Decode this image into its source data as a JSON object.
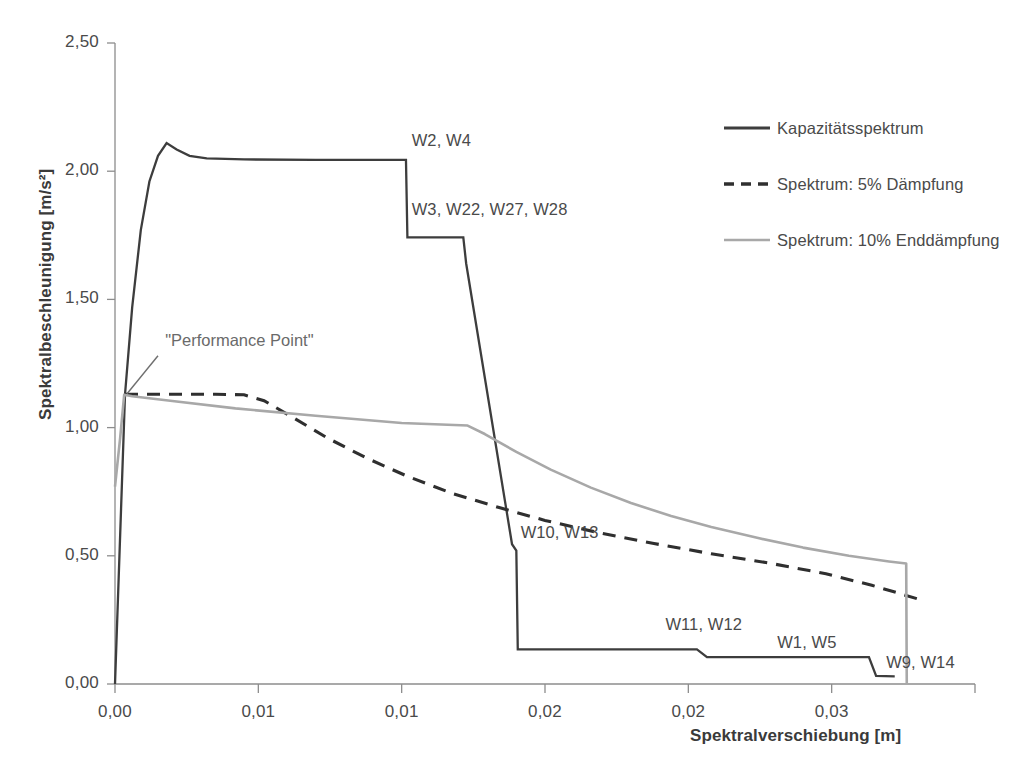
{
  "chart_data": {
    "type": "line",
    "title": "",
    "xlabel": "Spektralverschiebung [m]",
    "ylabel": "Spektralbeschleunigung [m/s²]",
    "xlim": [
      0,
      0.03
    ],
    "ylim": [
      0,
      2.5
    ],
    "grid": false,
    "legend_position": "right",
    "xticks": [
      0,
      0.005,
      0.01,
      0.015,
      0.02,
      0.025,
      0.03
    ],
    "xtick_labels": [
      "0,00",
      "0,01",
      "0,01",
      "0,02",
      "0,02",
      "0,03"
    ],
    "yticks": [
      0,
      0.5,
      1.0,
      1.5,
      2.0,
      2.5
    ],
    "ytick_labels": [
      "0,00",
      "0,50",
      "1,00",
      "1,50",
      "2,00",
      "2,50"
    ],
    "series": [
      {
        "name": "Kapazitätsspektrum",
        "style": "solid",
        "color": "#3d3d3d",
        "points": [
          [
            0.0,
            0.0
          ],
          [
            0.00035,
            1.13
          ],
          [
            0.0006,
            1.47
          ],
          [
            0.0009,
            1.77
          ],
          [
            0.0012,
            1.96
          ],
          [
            0.0015,
            2.06
          ],
          [
            0.0018,
            2.11
          ],
          [
            0.00215,
            2.085
          ],
          [
            0.0026,
            2.06
          ],
          [
            0.0032,
            2.05
          ],
          [
            0.0045,
            2.046
          ],
          [
            0.007,
            2.044
          ],
          [
            0.01015,
            2.044
          ],
          [
            0.0102,
            1.742
          ],
          [
            0.012,
            1.742
          ],
          [
            0.01215,
            1.742
          ],
          [
            0.01225,
            1.64
          ],
          [
            0.01385,
            0.545
          ],
          [
            0.014,
            0.52
          ],
          [
            0.01405,
            0.135
          ],
          [
            0.0203,
            0.135
          ],
          [
            0.02065,
            0.105
          ],
          [
            0.0263,
            0.105
          ],
          [
            0.02655,
            0.032
          ],
          [
            0.0272,
            0.03
          ]
        ]
      },
      {
        "name": "Spektrum: 5% Dämpfung",
        "style": "dashed",
        "color": "#2f2f2f",
        "points": [
          [
            0.00035,
            1.13
          ],
          [
            0.002,
            1.13
          ],
          [
            0.0035,
            1.13
          ],
          [
            0.0045,
            1.128
          ],
          [
            0.0052,
            1.105
          ],
          [
            0.0062,
            1.04
          ],
          [
            0.0074,
            0.96
          ],
          [
            0.0088,
            0.88
          ],
          [
            0.0102,
            0.81
          ],
          [
            0.0118,
            0.742
          ],
          [
            0.0134,
            0.688
          ],
          [
            0.015,
            0.638
          ],
          [
            0.0168,
            0.592
          ],
          [
            0.0188,
            0.548
          ],
          [
            0.0208,
            0.508
          ],
          [
            0.0228,
            0.472
          ],
          [
            0.0248,
            0.43
          ],
          [
            0.0264,
            0.385
          ],
          [
            0.0274,
            0.352
          ],
          [
            0.028,
            0.332
          ]
        ]
      },
      {
        "name": "Spektrum: 10% Enddämpfung",
        "style": "solid",
        "color": "#a8a8a8",
        "points": [
          [
            0.0,
            0.77
          ],
          [
            0.00018,
            0.96
          ],
          [
            0.00032,
            1.128
          ],
          [
            0.0006,
            1.122
          ],
          [
            0.002,
            1.104
          ],
          [
            0.0042,
            1.075
          ],
          [
            0.007,
            1.046
          ],
          [
            0.01,
            1.018
          ],
          [
            0.0123,
            1.008
          ],
          [
            0.0129,
            0.975
          ],
          [
            0.014,
            0.905
          ],
          [
            0.0152,
            0.836
          ],
          [
            0.0166,
            0.766
          ],
          [
            0.018,
            0.706
          ],
          [
            0.0194,
            0.655
          ],
          [
            0.0208,
            0.612
          ],
          [
            0.0224,
            0.57
          ],
          [
            0.024,
            0.532
          ],
          [
            0.0256,
            0.5
          ],
          [
            0.027,
            0.478
          ],
          [
            0.0276,
            0.47
          ],
          [
            0.02762,
            0.0
          ]
        ]
      }
    ],
    "point_labels": [
      {
        "text": "W2, W4",
        "x": 0.01035,
        "y": 2.115
      },
      {
        "text": "W3, W22, W27, W28",
        "x": 0.01035,
        "y": 1.845
      },
      {
        "text": "W10, W13",
        "x": 0.01415,
        "y": 0.585
      },
      {
        "text": "W11, W12",
        "x": 0.0192,
        "y": 0.225
      },
      {
        "text": "W1, W5",
        "x": 0.0231,
        "y": 0.155
      },
      {
        "text": "W9, W14",
        "x": 0.0269,
        "y": 0.078
      }
    ],
    "annotations": [
      {
        "text": "\"Performance Point\"",
        "x": 0.00175,
        "y": 1.335,
        "leader_from": [
          0.0015,
          1.28
        ],
        "leader_to": [
          0.00042,
          1.132
        ]
      }
    ]
  },
  "legend": {
    "items": [
      {
        "label": "Kapazitätsspektrum",
        "style": "solid",
        "color": "#3d3d3d"
      },
      {
        "label": "Spektrum: 5% Dämpfung",
        "style": "dashed",
        "color": "#2f2f2f"
      },
      {
        "label": "Spektrum: 10% Enddämpfung",
        "style": "solid",
        "color": "#a8a8a8"
      }
    ]
  }
}
